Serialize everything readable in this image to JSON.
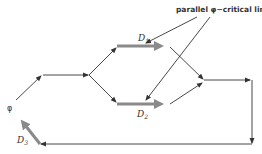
{
  "diagram": {
    "title_annotation": "parallel φ−critical links",
    "source_label": "φ",
    "link_labels": {
      "d1": "D",
      "d1_sub": "1",
      "d2": "D",
      "d2_sub": "2",
      "d3": "D",
      "d3_sub": "3"
    },
    "colors": {
      "line": "#333333",
      "critical_link": "#8a8a8a",
      "background": "#ffffff"
    },
    "nodes": [
      {
        "id": "phi",
        "label": "φ"
      },
      {
        "id": "n1"
      },
      {
        "id": "n2"
      },
      {
        "id": "n3_top"
      },
      {
        "id": "n3_bottom"
      },
      {
        "id": "n4_top"
      },
      {
        "id": "n4_bottom"
      },
      {
        "id": "n5"
      },
      {
        "id": "n6"
      },
      {
        "id": "n7"
      },
      {
        "id": "n8"
      }
    ],
    "critical_links": [
      "D1",
      "D2",
      "D3"
    ]
  }
}
